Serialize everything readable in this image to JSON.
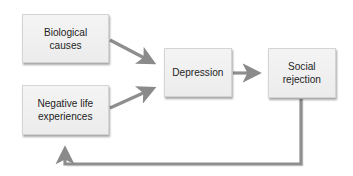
{
  "diagram": {
    "type": "flowchart",
    "nodes": [
      {
        "id": "biological",
        "label": "Biological\ncauses"
      },
      {
        "id": "negative",
        "label": "Negative life\nexperiences"
      },
      {
        "id": "depression",
        "label": "Depression"
      },
      {
        "id": "social",
        "label": "Social\nrejection"
      }
    ],
    "edges": [
      {
        "from": "biological",
        "to": "depression"
      },
      {
        "from": "negative",
        "to": "depression"
      },
      {
        "from": "depression",
        "to": "social"
      },
      {
        "from": "social",
        "to": "negative",
        "routing": "feedback-loop-below"
      }
    ],
    "colors": {
      "node_fill": "#efefef",
      "node_border": "#d4d4d4",
      "arrow": "#8a8a8a",
      "text": "#1e1e1e",
      "background": "#ffffff"
    }
  }
}
